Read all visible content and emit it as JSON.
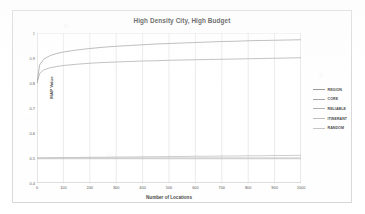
{
  "chart_data": {
    "type": "line",
    "title": "High Density City, High Budget",
    "xlabel": "Number of Locations",
    "ylabel": "MAP Value",
    "xlim": [
      0,
      1000
    ],
    "ylim": [
      0.4,
      1.0
    ],
    "grid": true,
    "legend_position": "right",
    "xticks": [
      "0",
      "100",
      "200",
      "300",
      "400",
      "500",
      "600",
      "700",
      "800",
      "900",
      "1000"
    ],
    "xtick_values": [
      0,
      100,
      200,
      300,
      400,
      500,
      600,
      700,
      800,
      900,
      1000
    ],
    "yticks": [
      "0.4",
      "0.5",
      "0.6",
      "0.7",
      "0.8",
      "0.9",
      "1"
    ],
    "ytick_values": [
      0.4,
      0.5,
      0.6,
      0.7,
      0.8,
      0.9,
      1.0
    ],
    "x": [
      0,
      10,
      25,
      50,
      75,
      100,
      150,
      200,
      250,
      300,
      350,
      400,
      450,
      500,
      550,
      600,
      650,
      700,
      750,
      800,
      850,
      900,
      950,
      1000
    ],
    "series": [
      {
        "name": "REGION",
        "color": "#9a9a9a",
        "values": [
          0.8,
          0.872,
          0.895,
          0.91,
          0.918,
          0.924,
          0.932,
          0.938,
          0.943,
          0.947,
          0.95,
          0.953,
          0.956,
          0.958,
          0.96,
          0.962,
          0.964,
          0.966,
          0.967,
          0.969,
          0.97,
          0.971,
          0.972,
          0.973
        ]
      },
      {
        "name": "CORE",
        "color": "#a5a5a5",
        "values": [
          0.8,
          0.838,
          0.852,
          0.861,
          0.866,
          0.87,
          0.875,
          0.879,
          0.882,
          0.884,
          0.886,
          0.888,
          0.889,
          0.891,
          0.892,
          0.893,
          0.894,
          0.895,
          0.896,
          0.897,
          0.898,
          0.899,
          0.9,
          0.901
        ]
      },
      {
        "name": "RELIABLE",
        "color": "#b0b0b0",
        "values": [
          0.5,
          0.5,
          0.5,
          0.5,
          0.5,
          0.5,
          0.5,
          0.5,
          0.5,
          0.5,
          0.5,
          0.5,
          0.5,
          0.5,
          0.5,
          0.5,
          0.5,
          0.5,
          0.5,
          0.5,
          0.5,
          0.5,
          0.5,
          0.5
        ]
      },
      {
        "name": "ITINERANT",
        "color": "#bdbdbd",
        "values": [
          0.5,
          0.5,
          0.5,
          0.501,
          0.501,
          0.502,
          0.502,
          0.503,
          0.503,
          0.504,
          0.504,
          0.505,
          0.505,
          0.506,
          0.506,
          0.507,
          0.507,
          0.508,
          0.508,
          0.509,
          0.509,
          0.51,
          0.51,
          0.511
        ]
      },
      {
        "name": "RANDOM",
        "color": "#c4c4c4",
        "values": [
          0.497,
          0.497,
          0.497,
          0.497,
          0.497,
          0.497,
          0.497,
          0.497,
          0.497,
          0.497,
          0.497,
          0.497,
          0.497,
          0.497,
          0.497,
          0.497,
          0.497,
          0.497,
          0.497,
          0.497,
          0.497,
          0.497,
          0.497,
          0.497
        ]
      }
    ]
  }
}
